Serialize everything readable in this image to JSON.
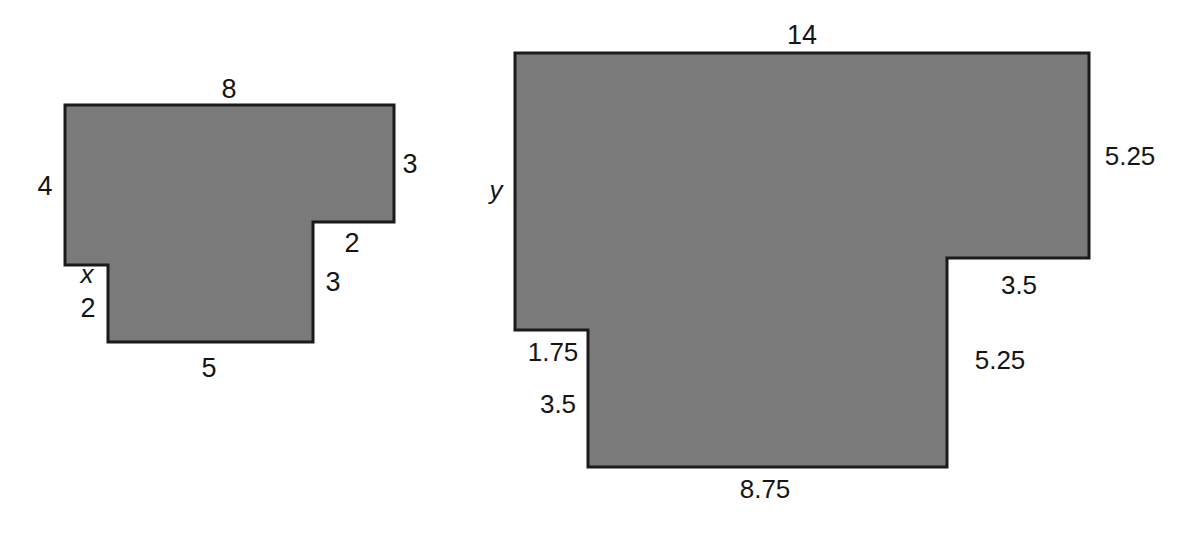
{
  "figure": {
    "title": "",
    "background_color": "#ffffff",
    "shape_fill_color": "#7a7a7a",
    "shape_stroke_color": "#1a1a1a",
    "label_color": "#151515",
    "shapes": [
      {
        "name": "left-polygon",
        "description": "T-shaped rectilinear polygon with unknown side x",
        "points": "65,105 394,105 394,222 313,222 313,342 108,342 108,265 65,265",
        "labels": [
          {
            "id": "top",
            "text": "8",
            "x": 229,
            "y": 89,
            "variable": false
          },
          {
            "id": "left",
            "text": "4",
            "x": 45,
            "y": 186,
            "variable": false
          },
          {
            "id": "right-upper",
            "text": "3",
            "x": 410,
            "y": 164,
            "variable": false
          },
          {
            "id": "right-step",
            "text": "2",
            "x": 352,
            "y": 243,
            "variable": false
          },
          {
            "id": "right-lower",
            "text": "3",
            "x": 333,
            "y": 282,
            "variable": false
          },
          {
            "id": "unknown-x",
            "text": "x",
            "x": 87,
            "y": 274,
            "variable": true
          },
          {
            "id": "left-lower",
            "text": "2",
            "x": 88,
            "y": 308,
            "variable": false
          },
          {
            "id": "bottom",
            "text": "5",
            "x": 209,
            "y": 368,
            "variable": false
          }
        ]
      },
      {
        "name": "right-polygon",
        "description": "Scaled copy of the left T-shaped polygon with unknown side y",
        "points": "515,53 1089,53 1089,258 947,258 947,467 588,467 588,330 515,330",
        "labels": [
          {
            "id": "top",
            "text": "14",
            "x": 802,
            "y": 35,
            "variable": false
          },
          {
            "id": "left",
            "text": "y",
            "x": 496,
            "y": 190,
            "variable": true
          },
          {
            "id": "right-upper",
            "text": "5.25",
            "x": 1130,
            "y": 156,
            "variable": false
          },
          {
            "id": "right-step",
            "text": "3.5",
            "x": 1019,
            "y": 285,
            "variable": false
          },
          {
            "id": "right-lower",
            "text": "5.25",
            "x": 1000,
            "y": 360,
            "variable": false
          },
          {
            "id": "left-notch",
            "text": "1.75",
            "x": 553,
            "y": 352,
            "variable": false
          },
          {
            "id": "left-lower",
            "text": "3.5",
            "x": 558,
            "y": 404,
            "variable": false
          },
          {
            "id": "bottom",
            "text": "8.75",
            "x": 765,
            "y": 489,
            "variable": false
          }
        ]
      }
    ]
  }
}
